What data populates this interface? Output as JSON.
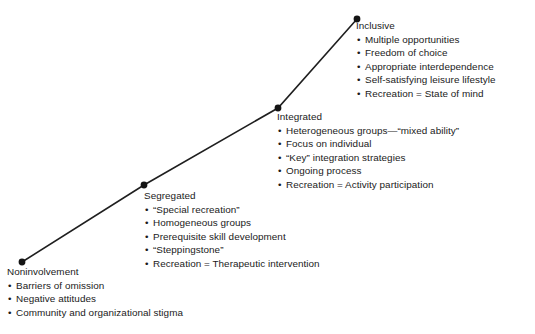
{
  "diagram": {
    "type": "ascending-continuum",
    "line_color": "#1f1f1f",
    "node_color": "#141414",
    "background_color": "#ffffff",
    "stages": [
      {
        "id": "noninvolvement",
        "title": "Noninvolvement",
        "node": {
          "x": 22,
          "y": 262
        },
        "items": [
          "Barriers of omission",
          "Negative attitudes",
          "Community and organizational stigma"
        ]
      },
      {
        "id": "segregated",
        "title": "Segregated",
        "node": {
          "x": 144,
          "y": 185
        },
        "items": [
          "“Special recreation”",
          "Homogeneous groups",
          "Prerequisite skill development",
          "“Steppingstone”",
          "Recreation = Therapeutic intervention"
        ]
      },
      {
        "id": "integrated",
        "title": "Integrated",
        "node": {
          "x": 278,
          "y": 108
        },
        "items": [
          "Heterogeneous groups—“mixed ability”",
          "Focus on individual",
          "“Key” integration strategies",
          "Ongoing process",
          "Recreation = Activity participation"
        ]
      },
      {
        "id": "inclusive",
        "title": "Inclusive",
        "node": {
          "x": 357,
          "y": 19
        },
        "items": [
          "Multiple opportunities",
          "Freedom of choice",
          "Appropriate interdependence",
          "Self-satisfying leisure lifestyle",
          "Recreation = State of mind"
        ]
      }
    ],
    "bullet_glyph": "•"
  }
}
